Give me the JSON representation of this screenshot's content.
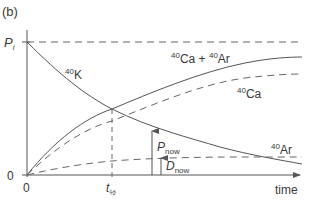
{
  "panel_label": "(b)",
  "axes": {
    "y_top_label": "P",
    "y_top_sub": "i",
    "y_zero": "0",
    "x_zero": "0",
    "x_half_label": "t",
    "x_half_sub": "½",
    "x_label": "time"
  },
  "curves": {
    "k40": {
      "sup": "40",
      "name": "K",
      "style": "solid"
    },
    "ca_ar": {
      "sup1": "40",
      "name1": "Ca",
      "plus": " + ",
      "sup2": "40",
      "name2": "Ar",
      "style": "solid"
    },
    "ca40": {
      "sup": "40",
      "name": "Ca",
      "style": "dashed"
    },
    "ar40": {
      "sup": "40",
      "name": "Ar",
      "style": "dashed"
    }
  },
  "annotations": {
    "p_now": {
      "label": "P",
      "sub": "now"
    },
    "d_now": {
      "label": "D",
      "sub": "now"
    }
  },
  "colors": {
    "line": "#555555",
    "text": "#3a3a3a"
  }
}
